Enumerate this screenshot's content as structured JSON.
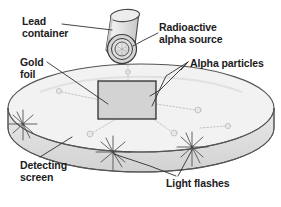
{
  "figure": {
    "name": "rutherford-gold-foil-experiment",
    "background_color": "#ffffff",
    "line_color": "#3a3a3a",
    "text_color": "#1b1b1b"
  },
  "labels": {
    "lead_container": "Lead\ncontainer",
    "gold_foil": "Gold\nfoil",
    "detecting_screen": "Detecting\nscreen",
    "radioactive_alpha_source": "Radioactive\nalpha source",
    "alpha_particles": "Alpha particles",
    "light_flashes": "Light flashes"
  },
  "parts": {
    "lead_container": {
      "name": "lead-container-cylinder",
      "fill": "#e2e2e2",
      "stroke": "#4a4a4a"
    },
    "alpha_source": {
      "name": "radioactive-alpha-source-aperture",
      "rings": 3,
      "fill": "#d9d9d9",
      "stroke": "#3d3d3d"
    },
    "gold_foil": {
      "name": "gold-foil-sheet",
      "fill": "#cfcfcf",
      "stroke": "#2f2f2f"
    },
    "detecting_screen": {
      "name": "detecting-screen-ring",
      "fill": "#e6e6e6",
      "stroke": "#4a4a4a"
    },
    "light_flashes": {
      "name": "light-flash-starburst",
      "count": 3,
      "stroke": "#4a4a4a"
    },
    "alpha_particles": {
      "name": "alpha-particle-track",
      "count": 7,
      "stroke": "#b9b9b9"
    }
  },
  "leader_lines": {
    "lead_container": "from 'Lead container' text to cylinder body",
    "gold_foil": "from 'Gold foil' text to foil sheet",
    "detecting_screen": "from 'Detecting screen' text to ring surface",
    "radioactive_alpha_source": "from 'Radioactive alpha source' text to cylinder aperture",
    "alpha_particles": "two leaders from 'Alpha particles' text to scattered tracks",
    "light_flashes": "two leaders from 'Light flashes' text to starbursts"
  }
}
